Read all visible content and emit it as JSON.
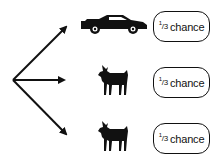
{
  "diagram": {
    "title": "",
    "outcomes": [
      {
        "prize": "car",
        "icon": "car-icon",
        "probability_num": "1",
        "probability_den": "3",
        "label": "chance"
      },
      {
        "prize": "goat",
        "icon": "goat-icon",
        "probability_num": "1",
        "probability_den": "3",
        "label": "chance"
      },
      {
        "prize": "goat",
        "icon": "goat-icon",
        "probability_num": "1",
        "probability_den": "3",
        "label": "chance"
      }
    ],
    "colors": {
      "ink": "#111111",
      "background": "#ffffff"
    }
  }
}
